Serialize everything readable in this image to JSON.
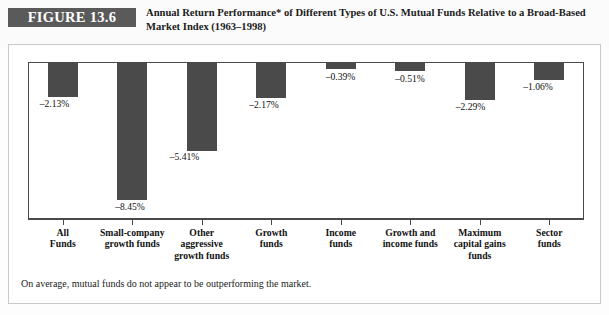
{
  "figure": {
    "number_label": "FIGURE 13.6",
    "title_line1": "Annual Return Performance* of Different Types of U.S. Mutual Funds Relative to a Broad-Based",
    "title_line2": "Market Index (1963–1998)",
    "footnote": "On average, mutual funds do not appear to be outperforming the market.",
    "accent_color": "#5a5a5a",
    "bar_color": "#4a4a4a",
    "frame_color": "#4a4a4a"
  },
  "chart_data": {
    "type": "bar",
    "title": "Annual Return Performance* of Different Types of U.S. Mutual Funds Relative to a Broad-Based Market Index (1963–1998)",
    "xlabel": "",
    "ylabel": "",
    "ylim": [
      -9.7,
      0
    ],
    "grid": false,
    "legend": "none",
    "orientation": "vertical",
    "categories": [
      "All Funds",
      "Small-company growth funds",
      "Other aggressive growth funds",
      "Growth funds",
      "Income funds",
      "Growth and income funds",
      "Maximum capital gains funds",
      "Sector funds"
    ],
    "category_lines": [
      [
        "All",
        "Funds"
      ],
      [
        "Small-company",
        "growth funds"
      ],
      [
        "Other",
        "aggressive",
        "growth funds"
      ],
      [
        "Growth",
        "funds"
      ],
      [
        "Income",
        "funds"
      ],
      [
        "Growth and",
        "income funds"
      ],
      [
        "Maximum",
        "capital gains",
        "funds"
      ],
      [
        "Sector",
        "funds"
      ]
    ],
    "values": [
      -2.13,
      -8.45,
      -5.41,
      -2.17,
      -0.39,
      -0.51,
      -2.29,
      -1.06
    ],
    "value_labels": [
      "–2.13%",
      "–8.45%",
      "–5.41%",
      "–2.17%",
      "–0.39%",
      "–0.51%",
      "–2.29%",
      "–1.06%"
    ]
  }
}
